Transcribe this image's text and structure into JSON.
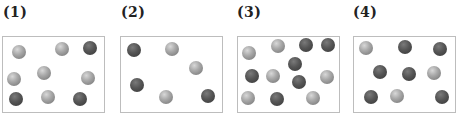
{
  "panels": [
    {
      "label": "(1)",
      "box": {
        "left": 2,
        "width": 103
      },
      "balls": [
        {
          "x": 19,
          "y": 52,
          "type": "light"
        },
        {
          "x": 62,
          "y": 49,
          "type": "light"
        },
        {
          "x": 90,
          "y": 48,
          "type": "dark"
        },
        {
          "x": 14,
          "y": 79,
          "type": "light"
        },
        {
          "x": 44,
          "y": 73,
          "type": "light"
        },
        {
          "x": 88,
          "y": 78,
          "type": "light"
        },
        {
          "x": 16,
          "y": 99,
          "type": "dark"
        },
        {
          "x": 48,
          "y": 97,
          "type": "light"
        },
        {
          "x": 80,
          "y": 99,
          "type": "dark"
        }
      ]
    },
    {
      "label": "(2)",
      "box": {
        "left": 120,
        "width": 103
      },
      "balls": [
        {
          "x": 134,
          "y": 50,
          "type": "dark"
        },
        {
          "x": 172,
          "y": 49,
          "type": "light"
        },
        {
          "x": 196,
          "y": 68,
          "type": "light"
        },
        {
          "x": 137,
          "y": 85,
          "type": "dark"
        },
        {
          "x": 166,
          "y": 97,
          "type": "light"
        },
        {
          "x": 208,
          "y": 96,
          "type": "dark"
        }
      ]
    },
    {
      "label": "(3)",
      "box": {
        "left": 237,
        "width": 103
      },
      "balls": [
        {
          "x": 249,
          "y": 53,
          "type": "light"
        },
        {
          "x": 278,
          "y": 46,
          "type": "light"
        },
        {
          "x": 306,
          "y": 45,
          "type": "dark"
        },
        {
          "x": 328,
          "y": 45,
          "type": "dark"
        },
        {
          "x": 295,
          "y": 64,
          "type": "dark"
        },
        {
          "x": 252,
          "y": 76,
          "type": "dark"
        },
        {
          "x": 273,
          "y": 76,
          "type": "light"
        },
        {
          "x": 299,
          "y": 82,
          "type": "dark"
        },
        {
          "x": 327,
          "y": 77,
          "type": "light"
        },
        {
          "x": 248,
          "y": 98,
          "type": "light"
        },
        {
          "x": 277,
          "y": 99,
          "type": "dark"
        },
        {
          "x": 313,
          "y": 98,
          "type": "light"
        }
      ]
    },
    {
      "label": "(4)",
      "box": {
        "left": 353,
        "width": 103
      },
      "balls": [
        {
          "x": 366,
          "y": 48,
          "type": "light"
        },
        {
          "x": 405,
          "y": 47,
          "type": "dark"
        },
        {
          "x": 440,
          "y": 49,
          "type": "dark"
        },
        {
          "x": 380,
          "y": 72,
          "type": "dark"
        },
        {
          "x": 409,
          "y": 74,
          "type": "dark"
        },
        {
          "x": 434,
          "y": 73,
          "type": "light"
        },
        {
          "x": 371,
          "y": 97,
          "type": "dark"
        },
        {
          "x": 397,
          "y": 96,
          "type": "light"
        },
        {
          "x": 442,
          "y": 97,
          "type": "dark"
        }
      ]
    }
  ],
  "colors": {
    "light_ball": "#a9a9a9",
    "dark_ball": "#4a4a4a",
    "box_border": "#bdbdbd"
  }
}
